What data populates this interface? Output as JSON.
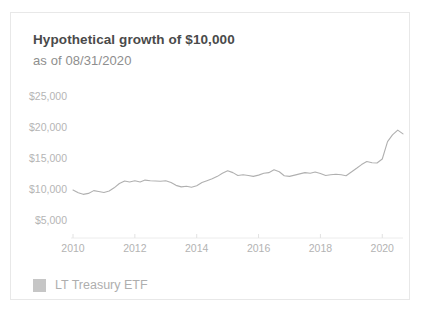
{
  "card": {
    "title": "Hypothetical growth of $10,000",
    "subtitle": "as of 08/31/2020"
  },
  "legend": {
    "swatch_color": "#c6c6c6",
    "label": "LT Treasury ETF"
  },
  "colors": {
    "line": "#b0b0b0",
    "axis_text": "#b3b3b3",
    "title_text": "#4a4a4a",
    "subtitle_text": "#8e8e8e",
    "card_border": "#e8e8e8",
    "background": "#ffffff"
  },
  "chart_data": {
    "type": "line",
    "title": "Hypothetical growth of $10,000",
    "subtitle": "as of 08/31/2020",
    "xlabel": "",
    "ylabel": "",
    "grid": false,
    "legend_position": "bottom-left",
    "xlim": [
      2010,
      2020.67
    ],
    "ylim": [
      5000,
      25000
    ],
    "ytick_values": [
      25000,
      20000,
      15000,
      10000,
      5000
    ],
    "ytick_labels": [
      "$25,000",
      "$20,000",
      "$15,000",
      "$10,000",
      "$5,000"
    ],
    "xtick_values": [
      2010,
      2012,
      2014,
      2016,
      2018,
      2020
    ],
    "xtick_labels": [
      "2010",
      "2012",
      "2014",
      "2016",
      "2018",
      "2020"
    ],
    "series": [
      {
        "name": "LT Treasury ETF",
        "color": "#b0b0b0",
        "x": [
          2010.0,
          2010.17,
          2010.33,
          2010.5,
          2010.67,
          2010.83,
          2011.0,
          2011.17,
          2011.33,
          2011.5,
          2011.67,
          2011.83,
          2012.0,
          2012.17,
          2012.33,
          2012.5,
          2012.67,
          2012.83,
          2013.0,
          2013.17,
          2013.33,
          2013.5,
          2013.67,
          2013.83,
          2014.0,
          2014.17,
          2014.33,
          2014.5,
          2014.67,
          2014.83,
          2015.0,
          2015.17,
          2015.33,
          2015.5,
          2015.67,
          2015.83,
          2016.0,
          2016.17,
          2016.33,
          2016.5,
          2016.67,
          2016.83,
          2017.0,
          2017.17,
          2017.33,
          2017.5,
          2017.67,
          2017.83,
          2018.0,
          2018.17,
          2018.33,
          2018.5,
          2018.67,
          2018.83,
          2019.0,
          2019.17,
          2019.33,
          2019.5,
          2019.67,
          2019.83,
          2020.0,
          2020.17,
          2020.33,
          2020.5,
          2020.67
        ],
        "y": [
          10000,
          9550,
          9300,
          9450,
          9900,
          9750,
          9600,
          9850,
          10350,
          11050,
          11450,
          11300,
          11500,
          11300,
          11600,
          11500,
          11450,
          11400,
          11500,
          11200,
          10750,
          10500,
          10600,
          10450,
          10700,
          11200,
          11500,
          11800,
          12200,
          12700,
          13100,
          12800,
          12350,
          12450,
          12350,
          12200,
          12400,
          12700,
          12800,
          13250,
          12950,
          12300,
          12200,
          12400,
          12600,
          12800,
          12700,
          12900,
          12650,
          12350,
          12450,
          12550,
          12450,
          12300,
          12900,
          13500,
          14100,
          14600,
          14400,
          14350,
          15000,
          17800,
          18900,
          19650,
          19050
        ]
      }
    ]
  }
}
